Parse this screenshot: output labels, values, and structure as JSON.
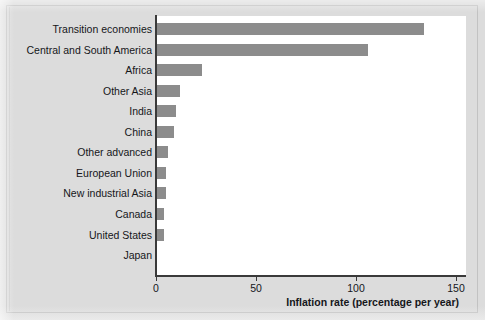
{
  "chart_data": {
    "type": "bar",
    "orientation": "horizontal",
    "title": "",
    "xlabel": "Inflation rate (percentage per year)",
    "ylabel": "",
    "xlim": [
      0,
      155
    ],
    "xticks": [
      0,
      50,
      100,
      150
    ],
    "xtick_labels": [
      "0",
      "50",
      "100",
      "150"
    ],
    "grid": false,
    "legend": null,
    "bar_color": "#8c8c8c",
    "plot_background": "#ffffff",
    "figure_background": "#dcdcdc",
    "axis_color": "#3a3a3a",
    "categories": [
      "Transition economies",
      "Central and South America",
      "Africa",
      "Other Asia",
      "India",
      "China",
      "Other advanced",
      "European Union",
      "New industrial Asia",
      "Canada",
      "United States",
      "Japan"
    ],
    "values": [
      134,
      106,
      23,
      12,
      10,
      9,
      6,
      5,
      5,
      4,
      4,
      0
    ]
  }
}
